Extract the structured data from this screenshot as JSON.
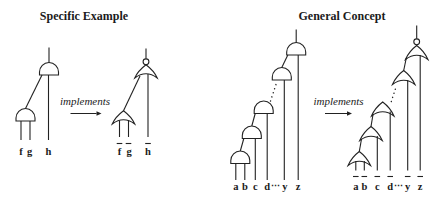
{
  "colors": {
    "ink": "#222222",
    "background": "#ffffff"
  },
  "specific": {
    "title": "Specific Example",
    "implements": "implements",
    "and_circuit": {
      "gate": "AND",
      "complemented_inputs": false,
      "labels": {
        "f": "f",
        "g": "g",
        "h": "h"
      }
    },
    "nor_circuit": {
      "gate": "NOR",
      "complemented_inputs": true,
      "labels": {
        "f": "f",
        "g": "g",
        "h": "h"
      }
    }
  },
  "general": {
    "title": "General Concept",
    "implements": "implements",
    "and_circuit": {
      "gate": "AND",
      "complemented_inputs": false,
      "labels": {
        "a": "a",
        "b": "b",
        "c": "c",
        "d": "d",
        "dots": "⋯",
        "y": "y",
        "z": "z"
      }
    },
    "nor_circuit": {
      "gate": "NOR",
      "complemented_inputs": true,
      "labels": {
        "a": "a",
        "b": "b",
        "c": "c",
        "d": "d",
        "dots": "⋯",
        "y": "y",
        "z": "z"
      }
    }
  }
}
